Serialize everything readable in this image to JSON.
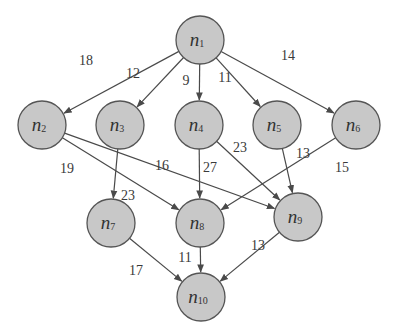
{
  "diagram": {
    "type": "weighted-directed-acyclic-graph",
    "colors": {
      "node_fill": "#c8c8c8",
      "node_stroke": "#555555",
      "edge": "#4a4a4a",
      "text": "#333333"
    },
    "nodes": [
      {
        "id": "n1",
        "base": "n",
        "sub": "1",
        "x": 200,
        "y": 40
      },
      {
        "id": "n2",
        "base": "n",
        "sub": "2",
        "x": 42,
        "y": 125
      },
      {
        "id": "n3",
        "base": "n",
        "sub": "3",
        "x": 120,
        "y": 125
      },
      {
        "id": "n4",
        "base": "n",
        "sub": "4",
        "x": 199,
        "y": 125
      },
      {
        "id": "n5",
        "base": "n",
        "sub": "5",
        "x": 277,
        "y": 125
      },
      {
        "id": "n6",
        "base": "n",
        "sub": "6",
        "x": 356,
        "y": 125
      },
      {
        "id": "n7",
        "base": "n",
        "sub": "7",
        "x": 111,
        "y": 223
      },
      {
        "id": "n8",
        "base": "n",
        "sub": "8",
        "x": 200,
        "y": 223
      },
      {
        "id": "n9",
        "base": "n",
        "sub": "9",
        "x": 298,
        "y": 217
      },
      {
        "id": "n10",
        "base": "n",
        "sub": "10",
        "x": 201,
        "y": 297
      }
    ],
    "edges": [
      {
        "from": "n1",
        "to": "n2",
        "weight": "18",
        "lx": 86,
        "ly": 65
      },
      {
        "from": "n1",
        "to": "n3",
        "weight": "12",
        "lx": 133,
        "ly": 78
      },
      {
        "from": "n1",
        "to": "n4",
        "weight": "9",
        "lx": 186,
        "ly": 85
      },
      {
        "from": "n1",
        "to": "n5",
        "weight": "11",
        "lx": 225,
        "ly": 82
      },
      {
        "from": "n1",
        "to": "n6",
        "weight": "14",
        "lx": 288,
        "ly": 60
      },
      {
        "from": "n2",
        "to": "n8",
        "weight": "19",
        "lx": 67,
        "ly": 173
      },
      {
        "from": "n2",
        "to": "n9",
        "weight": "16",
        "lx": 162,
        "ly": 170
      },
      {
        "from": "n3",
        "to": "n7",
        "weight": "23",
        "lx": 128,
        "ly": 200
      },
      {
        "from": "n4",
        "to": "n8",
        "weight": "27",
        "lx": 210,
        "ly": 172
      },
      {
        "from": "n4",
        "to": "n9",
        "weight": "23",
        "lx": 240,
        "ly": 152
      },
      {
        "from": "n5",
        "to": "n9",
        "weight": "13",
        "lx": 303,
        "ly": 158
      },
      {
        "from": "n6",
        "to": "n8",
        "weight": "15",
        "lx": 342,
        "ly": 172
      },
      {
        "from": "n7",
        "to": "n10",
        "weight": "17",
        "lx": 136,
        "ly": 275
      },
      {
        "from": "n8",
        "to": "n10",
        "weight": "11",
        "lx": 185,
        "ly": 262
      },
      {
        "from": "n9",
        "to": "n10",
        "weight": "13",
        "lx": 258,
        "ly": 250
      }
    ],
    "node_radius": 24
  }
}
